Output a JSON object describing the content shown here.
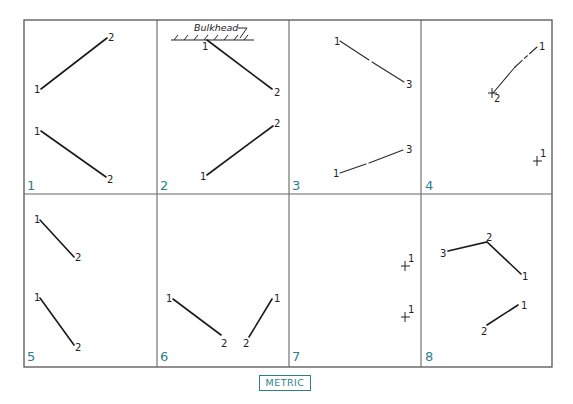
{
  "figure": {
    "badge": "METRIC",
    "accent_color": "#2d7f8c",
    "cells": [
      {
        "number": "1",
        "lines": [
          {
            "points": [
              {
                "label": "1"
              },
              {
                "label": "2"
              }
            ],
            "style": "solid"
          },
          {
            "points": [
              {
                "label": "1"
              },
              {
                "label": "2"
              }
            ],
            "style": "solid"
          }
        ]
      },
      {
        "number": "2",
        "annotation": "Bulkhead",
        "lines": [
          {
            "points": [
              {
                "label": "1"
              },
              {
                "label": "2"
              }
            ],
            "style": "solid"
          },
          {
            "points": [
              {
                "label": "1"
              },
              {
                "label": "2"
              }
            ],
            "style": "solid"
          }
        ]
      },
      {
        "number": "3",
        "lines": [
          {
            "points": [
              {
                "label": "1"
              },
              {
                "label": "3"
              }
            ],
            "style": "broken"
          },
          {
            "points": [
              {
                "label": "1"
              },
              {
                "label": "3"
              }
            ],
            "style": "broken"
          }
        ]
      },
      {
        "number": "4",
        "lines": [
          {
            "points": [
              {
                "label": "1"
              },
              {
                "label": "2"
              }
            ],
            "style": "dashed"
          }
        ],
        "marks": [
          {
            "label": "1"
          }
        ]
      },
      {
        "number": "5",
        "lines": [
          {
            "points": [
              {
                "label": "1"
              },
              {
                "label": "2"
              }
            ],
            "style": "solid"
          },
          {
            "points": [
              {
                "label": "1"
              },
              {
                "label": "2"
              }
            ],
            "style": "solid"
          }
        ]
      },
      {
        "number": "6",
        "lines": [
          {
            "points": [
              {
                "label": "1"
              },
              {
                "label": "2"
              }
            ],
            "style": "solid"
          },
          {
            "points": [
              {
                "label": "1"
              },
              {
                "label": "2"
              }
            ],
            "style": "solid"
          }
        ]
      },
      {
        "number": "7",
        "lines": [],
        "marks": [
          {
            "label": "1"
          },
          {
            "label": "1"
          }
        ]
      },
      {
        "number": "8",
        "lines": [
          {
            "points": [
              {
                "label": "3"
              },
              {
                "label": "2"
              },
              {
                "label": "1"
              }
            ],
            "style": "solid"
          },
          {
            "points": [
              {
                "label": "1"
              },
              {
                "label": "2"
              }
            ],
            "style": "solid"
          }
        ]
      }
    ]
  }
}
